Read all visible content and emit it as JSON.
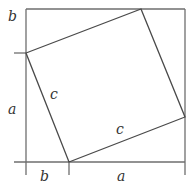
{
  "diagram": {
    "type": "pythagorean-proof",
    "colors": {
      "stroke": "#4a4a4a",
      "outer": "#6e6e6e",
      "text": "#333333",
      "background": "#ffffff"
    },
    "outer_square": {
      "x1": 26,
      "y1": 9,
      "x2": 185,
      "y2": 162
    },
    "inner_square": {
      "vertices": [
        {
          "name": "top",
          "x": 141,
          "y": 9
        },
        {
          "name": "right",
          "x": 185,
          "y": 117
        },
        {
          "name": "bottom",
          "x": 69,
          "y": 162
        },
        {
          "name": "left",
          "x": 26,
          "y": 53
        }
      ]
    },
    "labels": {
      "top_left_b": "b",
      "left_a": "a",
      "bottom_b": "b",
      "bottom_a": "a",
      "side_c_left": "c",
      "side_c_bottom": "c"
    }
  }
}
